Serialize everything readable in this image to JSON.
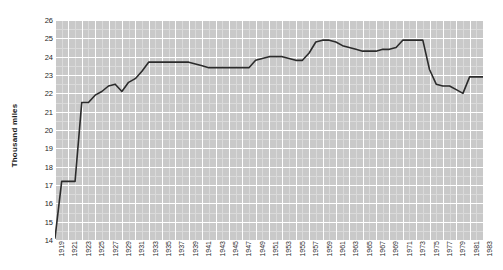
{
  "chart": {
    "type": "line",
    "title": "",
    "xlabel": "",
    "ylabel": "Thousand miles",
    "ylim": [
      14,
      26
    ],
    "ytick_step": 1,
    "grid": true,
    "legend": false,
    "line_color": "#2b2b2b",
    "panel_color": "#c9c9c9",
    "gridline_color": "#ffffff",
    "minor_gridline_color": "#dedede"
  },
  "chart_data": {
    "type": "line",
    "title": "",
    "xlabel": "",
    "ylabel": "Thousand miles",
    "ylim": [
      14,
      26
    ],
    "xlim": [
      1919,
      1983
    ],
    "grid": true,
    "legend": false,
    "ytick_labels": [
      "26",
      "25",
      "24",
      "23",
      "22",
      "21",
      "20",
      "19",
      "18",
      "17",
      "16",
      "15",
      "14"
    ],
    "ytick_values": [
      26,
      25,
      24,
      23,
      22,
      21,
      20,
      19,
      18,
      17,
      16,
      15,
      14
    ],
    "xtick_labels": [
      "1919",
      "1921",
      "1923",
      "1925",
      "1927",
      "1929",
      "1931",
      "1933",
      "1935",
      "1937",
      "1939",
      "1941",
      "1943",
      "1945",
      "1947",
      "1949",
      "1951",
      "1953",
      "1955",
      "1957",
      "1959",
      "1961",
      "1963",
      "1965",
      "1967",
      "1969",
      "1971",
      "1973",
      "1975",
      "1977",
      "1979",
      "1981",
      "1983"
    ],
    "xtick_values": [
      1919,
      1921,
      1923,
      1925,
      1927,
      1929,
      1931,
      1933,
      1935,
      1937,
      1939,
      1941,
      1943,
      1945,
      1947,
      1949,
      1951,
      1953,
      1955,
      1957,
      1959,
      1961,
      1963,
      1965,
      1967,
      1969,
      1971,
      1973,
      1975,
      1977,
      1979,
      1981,
      1983
    ],
    "x": [
      1919,
      1920,
      1921,
      1922,
      1923,
      1924,
      1925,
      1926,
      1927,
      1928,
      1929,
      1930,
      1931,
      1932,
      1933,
      1934,
      1935,
      1936,
      1937,
      1938,
      1939,
      1940,
      1941,
      1942,
      1943,
      1944,
      1945,
      1946,
      1947,
      1948,
      1949,
      1950,
      1951,
      1952,
      1953,
      1954,
      1955,
      1956,
      1957,
      1958,
      1959,
      1960,
      1961,
      1962,
      1963,
      1964,
      1965,
      1966,
      1967,
      1968,
      1969,
      1970,
      1971,
      1972,
      1973,
      1974,
      1975,
      1976,
      1977,
      1978,
      1979,
      1980,
      1981,
      1982,
      1983
    ],
    "values": [
      14.1,
      17.2,
      17.2,
      17.2,
      21.5,
      21.5,
      21.9,
      22.1,
      22.4,
      22.5,
      22.1,
      22.6,
      22.8,
      23.2,
      23.7,
      23.7,
      23.7,
      23.7,
      23.7,
      23.7,
      23.7,
      23.6,
      23.5,
      23.4,
      23.4,
      23.4,
      23.4,
      23.4,
      23.4,
      23.4,
      23.8,
      23.9,
      24.0,
      24.0,
      24.0,
      23.9,
      23.8,
      23.8,
      24.2,
      24.8,
      24.9,
      24.9,
      24.8,
      24.6,
      24.5,
      24.4,
      24.3,
      24.3,
      24.3,
      24.4,
      24.4,
      24.5,
      24.9,
      24.9,
      24.9,
      24.9,
      23.3,
      22.5,
      22.4,
      22.4,
      22.2,
      22.0,
      22.9,
      22.9,
      22.9
    ],
    "series": [
      {
        "name": "Thousand miles",
        "values": [
          14.1,
          17.2,
          17.2,
          17.2,
          21.5,
          21.5,
          21.9,
          22.1,
          22.4,
          22.5,
          22.1,
          22.6,
          22.8,
          23.2,
          23.7,
          23.7,
          23.7,
          23.7,
          23.7,
          23.7,
          23.7,
          23.6,
          23.5,
          23.4,
          23.4,
          23.4,
          23.4,
          23.4,
          23.4,
          23.4,
          23.8,
          23.9,
          24.0,
          24.0,
          24.0,
          23.9,
          23.8,
          23.8,
          24.2,
          24.8,
          24.9,
          24.9,
          24.8,
          24.6,
          24.5,
          24.4,
          24.3,
          24.3,
          24.3,
          24.4,
          24.4,
          24.5,
          24.9,
          24.9,
          24.9,
          24.9,
          23.3,
          22.5,
          22.4,
          22.4,
          22.2,
          22.0,
          22.9,
          22.9,
          22.9
        ]
      }
    ]
  }
}
